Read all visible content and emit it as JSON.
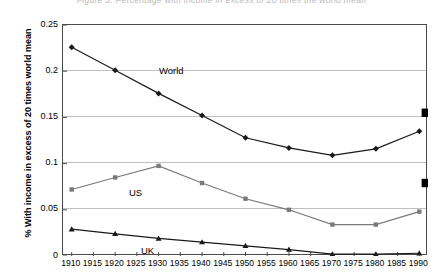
{
  "figure": {
    "top_caption_fragment": "Figure 3.  Percentage with income in excess of 20 times the world mean"
  },
  "axes": {
    "ylabel": "% With income in excess of 20 times world mean",
    "yticks": [
      "0.25",
      "0.2",
      "0.15",
      "0.1",
      "0.05",
      "0"
    ],
    "xticks": [
      "1910",
      "1915",
      "1920",
      "1925",
      "1930",
      "1935",
      "1940",
      "1945",
      "1950",
      "1955",
      "1960",
      "1965",
      "1970",
      "1975",
      "1980",
      "1985",
      "1990"
    ]
  },
  "series_labels": {
    "world": "World",
    "us": "US",
    "uk": "UK"
  },
  "colors": {
    "world_line": "#1a1a1a",
    "us_line": "#7a7a7a",
    "uk_line": "#1a1a1a",
    "gridline": "#c0c0c0",
    "axis": "#4a4a4a",
    "projection_marker": "#000000"
  },
  "chart_data": {
    "type": "line",
    "title": "",
    "xlabel": "",
    "ylabel": "% With income in excess of 20 times world mean",
    "x": [
      1910,
      1920,
      1930,
      1940,
      1950,
      1960,
      1970,
      1980,
      1990
    ],
    "xlim": [
      1908,
      1992
    ],
    "ylim": [
      0,
      0.25
    ],
    "ytick_values": [
      0,
      0.05,
      0.1,
      0.15,
      0.2,
      0.25
    ],
    "grid": true,
    "legend_position": "inline-labels",
    "series": [
      {
        "name": "World",
        "color": "#1a1a1a",
        "marker": "diamond",
        "values": [
          0.226,
          0.201,
          0.176,
          0.152,
          0.128,
          0.117,
          0.109,
          0.116,
          0.135
        ]
      },
      {
        "name": "US",
        "color": "#7a7a7a",
        "marker": "square",
        "values": [
          0.072,
          0.085,
          0.0975,
          0.079,
          0.062,
          0.05,
          0.034,
          0.034,
          0.048
        ]
      },
      {
        "name": "UK",
        "color": "#1a1a1a",
        "marker": "triangle",
        "values": [
          0.029,
          0.024,
          0.019,
          0.015,
          0.011,
          0.007,
          0.002,
          0.002,
          0.003
        ]
      }
    ],
    "projection_markers": [
      {
        "series": "World",
        "x": 1991.5,
        "value": 0.155
      },
      {
        "series": "US",
        "x": 1991.5,
        "value": 0.079
      }
    ]
  }
}
